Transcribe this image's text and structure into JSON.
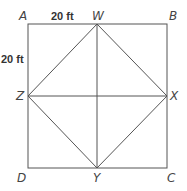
{
  "diagram": {
    "vertices": {
      "A": "A",
      "B": "B",
      "C": "C",
      "D": "D",
      "W": "W",
      "X": "X",
      "Y": "Y",
      "Z": "Z"
    },
    "dimensions": {
      "top": "20 ft",
      "left": "20 ft"
    },
    "colors": {
      "line": "#555555",
      "text": "#444444"
    }
  }
}
